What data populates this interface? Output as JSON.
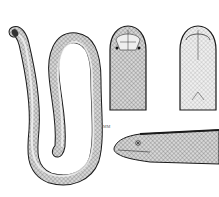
{
  "figure": {
    "panels": [
      {
        "name": "full-body",
        "description": "whole snake in S-shaped coil"
      },
      {
        "name": "head-dorsal",
        "description": "head, dorsal view"
      },
      {
        "name": "head-ventral",
        "description": "head, ventral view"
      },
      {
        "name": "head-lateral",
        "description": "head, lateral view"
      }
    ],
    "scale_label": "MM"
  },
  "colors": {
    "background": "#ffffff",
    "ink": "#1a1a1a",
    "shade": "#8a8a8a"
  }
}
